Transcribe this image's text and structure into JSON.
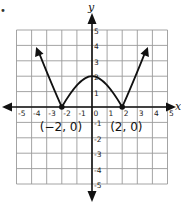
{
  "bullet": "•",
  "axes": {
    "x_label": "x",
    "y_label": "y",
    "x_ticks": [
      "-5",
      "-4",
      "-3",
      "-2",
      "-1",
      "0",
      "1",
      "2",
      "3",
      "4",
      "5"
    ],
    "y_ticks_pos": [
      "1",
      "2",
      "3",
      "4",
      "5"
    ],
    "y_ticks_neg": [
      "-1",
      "-2",
      "-3",
      "-4",
      "-5"
    ]
  },
  "points": [
    {
      "label": "(−2, 0)",
      "x": -2,
      "y": 0
    },
    {
      "label": "(2, 0)",
      "x": 2,
      "y": 0
    }
  ],
  "colors": {
    "grid": "#9a9a9a",
    "axis": "#111111",
    "curve": "#111111"
  },
  "chart_data": {
    "type": "line",
    "title": "",
    "xlabel": "x",
    "ylabel": "y",
    "xlim": [
      -5,
      5
    ],
    "ylim": [
      -5,
      5
    ],
    "grid": true,
    "series": [
      {
        "name": "f(x)",
        "x": [
          -3.5,
          -3,
          -2.5,
          -2,
          -1.5,
          -1,
          -0.5,
          0,
          0.5,
          1,
          1.5,
          2,
          2.5,
          3,
          3.5
        ],
        "y": [
          3.5,
          2.1,
          0.9,
          0,
          0.6,
          1.3,
          1.8,
          2,
          1.8,
          1.3,
          0.6,
          0,
          0.9,
          2.1,
          3.5
        ],
        "end_arrows": true
      }
    ],
    "annotations": [
      {
        "text": "(−2, 0)",
        "x": -2,
        "y": 0
      },
      {
        "text": "(2, 0)",
        "x": 2,
        "y": 0
      }
    ],
    "x_ticks": [
      -5,
      -4,
      -3,
      -2,
      -1,
      0,
      1,
      2,
      3,
      4,
      5
    ],
    "y_ticks": [
      -5,
      -4,
      -3,
      -2,
      -1,
      1,
      2,
      3,
      4,
      5
    ]
  }
}
